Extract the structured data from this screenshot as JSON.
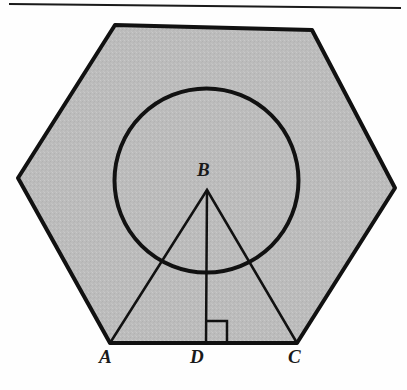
{
  "figure": {
    "background_color": "#fefefe",
    "top_rule": {
      "name": "top-horizontal-rule",
      "x1": 10,
      "y1": 4,
      "x2": 400,
      "y2": 8,
      "color": "#1a1a1a",
      "width": 2
    },
    "hexagon": {
      "name": "shaded-hexagon",
      "fill_color": "#bcbcbc",
      "stroke_color": "#111111",
      "stroke_width": 4,
      "points": "115,25 312,30 395,188 297,343 110,343 18,178",
      "vertices": [
        {
          "label": "top-left",
          "x": 115,
          "y": 25
        },
        {
          "label": "top-right",
          "x": 312,
          "y": 30
        },
        {
          "label": "right",
          "x": 395,
          "y": 188
        },
        {
          "label": "bottom-right",
          "x": 297,
          "y": 343
        },
        {
          "label": "bottom-left",
          "x": 110,
          "y": 343
        },
        {
          "label": "left",
          "x": 18,
          "y": 178
        }
      ]
    },
    "circle": {
      "name": "inscribed-circle",
      "cx": 206.5,
      "cy": 180.5,
      "r": 92,
      "fill": "none",
      "stroke_color": "#111111",
      "stroke_width": 4
    },
    "triangle": {
      "name": "triangle-abc",
      "points": "110,343 207,190 297,343",
      "fill": "none",
      "stroke_color": "#111111",
      "stroke_width": 2.5
    },
    "altitude": {
      "name": "altitude-bd",
      "x1": 207,
      "y1": 190,
      "x2": 206,
      "y2": 343,
      "stroke_color": "#111111",
      "stroke_width": 2.5
    },
    "right_angle_marker": {
      "name": "right-angle-marker-at-d",
      "points": "206,321 227,321 227,343",
      "stroke_color": "#111111",
      "stroke_width": 2.5
    },
    "points": [
      {
        "id": "A",
        "label": "A",
        "x": 110,
        "y": 343,
        "label_x": 99,
        "label_y": 347
      },
      {
        "id": "B",
        "label": "B",
        "x": 207,
        "y": 190,
        "label_x": 197,
        "label_y": 160
      },
      {
        "id": "C",
        "label": "C",
        "x": 297,
        "y": 343,
        "label_x": 288,
        "label_y": 347
      },
      {
        "id": "D",
        "label": "D",
        "x": 206,
        "y": 343,
        "label_x": 190,
        "label_y": 347
      }
    ]
  }
}
